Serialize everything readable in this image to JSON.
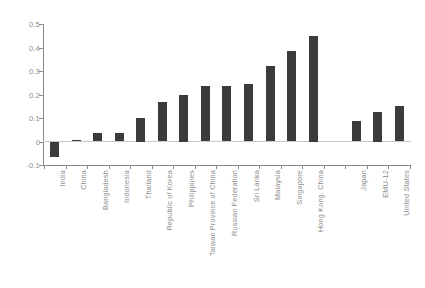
{
  "chart_data": {
    "type": "bar",
    "title": "",
    "subtitle": "",
    "xlabel": "",
    "ylabel": "",
    "ylim": [
      -0.1,
      0.5
    ],
    "ytick_labels": [
      "0.5",
      "0.4",
      "0.3",
      "0.2",
      "0.1",
      "0",
      "-0.1"
    ],
    "ytick_values": [
      0.5,
      0.4,
      0.3,
      0.2,
      0.1,
      0,
      -0.1
    ],
    "grid": false,
    "legend": null,
    "zero_line": true,
    "bar_color": "#3b3b3b",
    "axis_color": "#8a8a8a",
    "tick_label_color": "#8d8d8d",
    "categories": [
      "India",
      "China",
      "Bangladesh",
      "Indonesia",
      "Thailand",
      "Republic of Korea",
      "Philippines",
      "Taiwan Province of China",
      "Russian Federation",
      "Sri Lanka",
      "Malaysia",
      "Singapore",
      "Hong Kong, China",
      "",
      "Japan",
      "EMU-12",
      "United States"
    ],
    "values": [
      -0.065,
      0.008,
      0.035,
      0.038,
      0.1,
      0.17,
      0.2,
      0.235,
      0.235,
      0.245,
      0.32,
      0.385,
      0.45,
      null,
      0.088,
      0.125,
      0.152
    ],
    "gap_slot_index": 13
  }
}
